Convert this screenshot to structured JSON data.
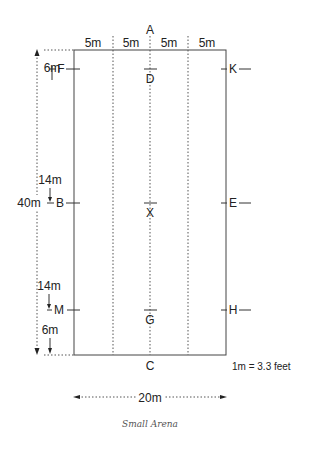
{
  "diagram": {
    "caption": "Small Arena",
    "conversion_note": "1m = 3.3 feet",
    "width_label": "20m",
    "length_label": "40m",
    "segment_labels": [
      "5m",
      "5m",
      "5m",
      "5m"
    ],
    "spacing_labels": {
      "top_to_f": "6m",
      "f_to_b": "14m",
      "b_to_m": "14m",
      "m_to_bottom": "6m"
    },
    "letters": {
      "top": "A",
      "bottom": "C",
      "left": [
        "F",
        "B",
        "M"
      ],
      "centre": [
        "D",
        "X",
        "G"
      ],
      "right": [
        "K",
        "E",
        "H"
      ]
    },
    "colors": {
      "line": "#333333",
      "dotted": "#555555",
      "caption": "#555555"
    }
  }
}
